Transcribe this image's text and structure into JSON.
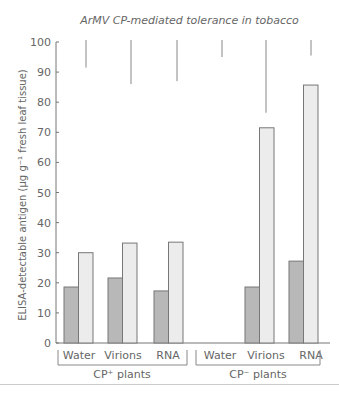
{
  "chart_data": {
    "type": "bar",
    "title": "ArMV CP-mediated tolerance in tobacco",
    "xlabel": "",
    "ylabel": "ELISA-detectable antigen (µg g⁻¹ fresh leaf tissue)",
    "ylim": [
      0,
      100
    ],
    "yticks": [
      0,
      10,
      20,
      30,
      40,
      50,
      60,
      70,
      80,
      90,
      100
    ],
    "grid": false,
    "groups": [
      {
        "label": "CP⁺ plants",
        "categories": [
          "Water",
          "Virions",
          "RNA"
        ]
      },
      {
        "label": "CP⁻ plants",
        "categories": [
          "Water",
          "Virions",
          "RNA"
        ]
      }
    ],
    "categories": [
      "Water",
      "Virions",
      "RNA",
      "Water",
      "Virions",
      "RNA"
    ],
    "series": [
      {
        "name": "dark bars",
        "color": "#b8b8b8",
        "values": [
          18.6,
          21.6,
          17.3,
          null,
          18.6,
          27.2
        ]
      },
      {
        "name": "light bars",
        "color": "#ececec",
        "values": [
          30.0,
          33.2,
          33.5,
          null,
          71.5,
          85.7
        ]
      }
    ],
    "error_bar_lines": [
      {
        "from": 100,
        "to": 91.5
      },
      {
        "from": 100,
        "to": 86
      },
      {
        "from": 100,
        "to": 87
      },
      {
        "from": 100,
        "to": 95
      },
      {
        "from": 100,
        "to": 76.5
      },
      {
        "from": 100,
        "to": 95.5
      }
    ]
  },
  "labels": {
    "title": "ArMV CP-mediated tolerance in tobacco",
    "ylabel": "ELISA-detectable antigen (µg g⁻¹ fresh leaf tissue)",
    "group1": "CP⁺ plants",
    "group2": "CP⁻ plants",
    "cats": [
      "Water",
      "Virions",
      "RNA",
      "Water",
      "Virions",
      "RNA"
    ],
    "yticks": [
      "0",
      "10",
      "20",
      "30",
      "40",
      "50",
      "60",
      "70",
      "80",
      "90",
      "100"
    ]
  }
}
